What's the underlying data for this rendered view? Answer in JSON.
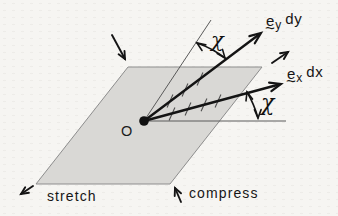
{
  "diagram": {
    "origin_label": "O",
    "bottom_labels": {
      "stretch": "stretch",
      "compress": "compress"
    },
    "angle_labels": {
      "top": "χ",
      "right": "χ"
    },
    "vector_labels": {
      "ey": {
        "symbol": "e",
        "under_tilde": "~",
        "subscript": "y",
        "differential": "dy"
      },
      "ex": {
        "symbol": "e",
        "under_tilde": "~",
        "subscript": "x",
        "differential": "dx"
      }
    },
    "colors": {
      "background": "#f6f5f2",
      "plane_fill": "#d9d8d5",
      "plane_edge": "#8d8d8d",
      "ink": "#141414",
      "thin_line": "#5a5a5a",
      "hatch": "#4f4f4f"
    }
  }
}
